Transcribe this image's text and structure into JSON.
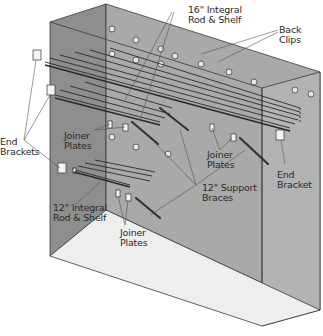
{
  "diagram": {
    "type": "exploded-assembly",
    "colors": {
      "left_wall": "#8e8e8e",
      "back_wall": "#a9a9a9",
      "right_wall": "#b3b3b3",
      "floor": "#eeeeee",
      "outline": "#3a3a3a",
      "leader": "#555555",
      "text": "#2a2a2a"
    },
    "labels": {
      "rod_shelf_16": "16\" Integral\nRod & Shelf",
      "back_clips": "Back\nClips",
      "end_brackets": "End\nBrackets",
      "joiner_plates_left": "Joiner\nPlates",
      "joiner_plates_right": "Joiner\nPlates",
      "end_bracket_right": "End\nBracket",
      "support_braces": "12\" Support\nBraces",
      "rod_shelf_12": "12\" Integral\nRod & Shelf",
      "joiner_plates_bottom": "Joiner\nPlates"
    }
  }
}
